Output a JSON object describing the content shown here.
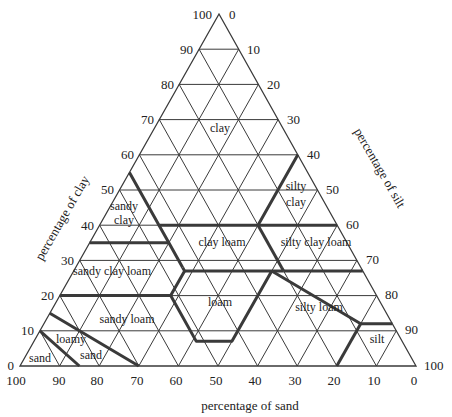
{
  "diagram": {
    "axes": {
      "clay_label": "percentage of clay",
      "silt_label": "percentage of silt",
      "sand_label": "percentage of sand"
    },
    "clay_ticks": [
      "0",
      "10",
      "20",
      "30",
      "40",
      "50",
      "60",
      "70",
      "80",
      "90",
      "100"
    ],
    "silt_ticks": [
      "0",
      "10",
      "20",
      "30",
      "40",
      "50",
      "60",
      "70",
      "80",
      "90",
      "100"
    ],
    "sand_ticks": [
      "100",
      "90",
      "80",
      "70",
      "60",
      "50",
      "40",
      "30",
      "20",
      "10",
      "0"
    ],
    "zones": [
      {
        "name": "clay",
        "label": "clay"
      },
      {
        "name": "silty-clay",
        "label_line1": "silty",
        "label_line2": "clay"
      },
      {
        "name": "sandy-clay",
        "label_line1": "sandy",
        "label_line2": "clay"
      },
      {
        "name": "clay-loam",
        "label": "clay loam"
      },
      {
        "name": "silty-clay-loam",
        "label": "silty clay loam"
      },
      {
        "name": "sandy-clay-loam",
        "label": "sandy clay loam"
      },
      {
        "name": "loam",
        "label": "loam"
      },
      {
        "name": "silty-loam",
        "label": "silty loam"
      },
      {
        "name": "sandy-loam",
        "label": "sandy loam"
      },
      {
        "name": "loamy-sand",
        "label_line1": "loamy",
        "label_line2": "sand"
      },
      {
        "name": "sand",
        "label": "sand"
      },
      {
        "name": "silt",
        "label": "silt"
      }
    ],
    "colors": {
      "line": "#3a3a3a",
      "text": "#222222",
      "background": "#ffffff"
    }
  }
}
